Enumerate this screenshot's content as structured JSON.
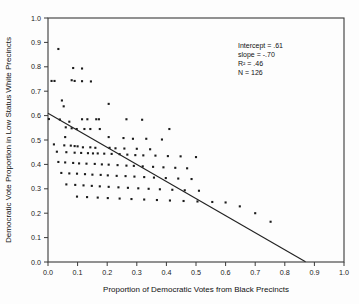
{
  "chart_data": {
    "type": "scatter",
    "title": "",
    "xlabel": "Proportion of Democratic Votes from Black Precincts",
    "ylabel": "Democratic Vote Proportion in Low Status White Precincts",
    "xlim": [
      0.0,
      1.0
    ],
    "ylim": [
      0.0,
      1.0
    ],
    "grid": false,
    "legend": null,
    "xticks": [
      "0.0",
      "0.1",
      "0.2",
      "0.3",
      "0.4",
      "0.5",
      "0.6",
      "0.7",
      "0.8",
      "0.9",
      "1.0"
    ],
    "yticks": [
      "0.0",
      "0.1",
      "0.2",
      "0.3",
      "0.4",
      "0.5",
      "0.6",
      "0.7",
      "0.8",
      "0.9",
      "1.0"
    ],
    "annotations": {
      "intercept_label": "Intercept = .61",
      "slope_label": "slope = -.70",
      "r2_label": "R² = .46",
      "n_label": "N = 126"
    },
    "regression": {
      "intercept": 0.61,
      "slope": -0.7,
      "r_squared": 0.46,
      "n": 126,
      "x_start": 0.0,
      "x_end": 0.87
    },
    "points": [
      [
        0.035,
        0.873
      ],
      [
        0.085,
        0.795
      ],
      [
        0.115,
        0.793
      ],
      [
        0.012,
        0.742
      ],
      [
        0.022,
        0.742
      ],
      [
        0.08,
        0.745
      ],
      [
        0.09,
        0.742
      ],
      [
        0.115,
        0.741
      ],
      [
        0.145,
        0.74
      ],
      [
        0.047,
        0.662
      ],
      [
        0.053,
        0.638
      ],
      [
        0.205,
        0.648
      ],
      [
        0.003,
        0.586
      ],
      [
        0.04,
        0.584
      ],
      [
        0.072,
        0.575
      ],
      [
        0.115,
        0.585
      ],
      [
        0.133,
        0.585
      ],
      [
        0.163,
        0.585
      ],
      [
        0.172,
        0.585
      ],
      [
        0.265,
        0.585
      ],
      [
        0.318,
        0.583
      ],
      [
        0.06,
        0.552
      ],
      [
        0.08,
        0.548
      ],
      [
        0.097,
        0.545
      ],
      [
        0.123,
        0.545
      ],
      [
        0.143,
        0.545
      ],
      [
        0.175,
        0.545
      ],
      [
        0.41,
        0.545
      ],
      [
        0.058,
        0.512
      ],
      [
        0.205,
        0.512
      ],
      [
        0.255,
        0.508
      ],
      [
        0.287,
        0.505
      ],
      [
        0.332,
        0.505
      ],
      [
        0.385,
        0.502
      ],
      [
        0.02,
        0.482
      ],
      [
        0.055,
        0.478
      ],
      [
        0.077,
        0.477
      ],
      [
        0.09,
        0.475
      ],
      [
        0.1,
        0.474
      ],
      [
        0.118,
        0.47
      ],
      [
        0.143,
        0.47
      ],
      [
        0.16,
        0.468
      ],
      [
        0.208,
        0.468
      ],
      [
        0.228,
        0.466
      ],
      [
        0.258,
        0.465
      ],
      [
        0.3,
        0.464
      ],
      [
        0.345,
        0.462
      ],
      [
        0.03,
        0.452
      ],
      [
        0.062,
        0.45
      ],
      [
        0.09,
        0.448
      ],
      [
        0.112,
        0.447
      ],
      [
        0.135,
        0.446
      ],
      [
        0.152,
        0.445
      ],
      [
        0.168,
        0.445
      ],
      [
        0.19,
        0.444
      ],
      [
        0.215,
        0.443
      ],
      [
        0.242,
        0.442
      ],
      [
        0.268,
        0.44
      ],
      [
        0.295,
        0.438
      ],
      [
        0.322,
        0.437
      ],
      [
        0.363,
        0.436
      ],
      [
        0.405,
        0.434
      ],
      [
        0.448,
        0.433
      ],
      [
        0.5,
        0.43
      ],
      [
        0.035,
        0.41
      ],
      [
        0.058,
        0.408
      ],
      [
        0.085,
        0.406
      ],
      [
        0.105,
        0.404
      ],
      [
        0.13,
        0.403
      ],
      [
        0.158,
        0.402
      ],
      [
        0.182,
        0.4
      ],
      [
        0.205,
        0.399
      ],
      [
        0.235,
        0.397
      ],
      [
        0.265,
        0.395
      ],
      [
        0.29,
        0.394
      ],
      [
        0.32,
        0.392
      ],
      [
        0.355,
        0.39
      ],
      [
        0.39,
        0.388
      ],
      [
        0.43,
        0.386
      ],
      [
        0.47,
        0.384
      ],
      [
        0.045,
        0.365
      ],
      [
        0.072,
        0.363
      ],
      [
        0.098,
        0.362
      ],
      [
        0.125,
        0.36
      ],
      [
        0.15,
        0.358
      ],
      [
        0.178,
        0.357
      ],
      [
        0.202,
        0.355
      ],
      [
        0.232,
        0.353
      ],
      [
        0.262,
        0.352
      ],
      [
        0.292,
        0.35
      ],
      [
        0.325,
        0.348
      ],
      [
        0.358,
        0.346
      ],
      [
        0.398,
        0.344
      ],
      [
        0.44,
        0.342
      ],
      [
        0.485,
        0.34
      ],
      [
        0.062,
        0.318
      ],
      [
        0.092,
        0.316
      ],
      [
        0.12,
        0.314
      ],
      [
        0.148,
        0.312
      ],
      [
        0.175,
        0.31
      ],
      [
        0.205,
        0.308
      ],
      [
        0.238,
        0.306
      ],
      [
        0.27,
        0.304
      ],
      [
        0.305,
        0.302
      ],
      [
        0.34,
        0.3
      ],
      [
        0.378,
        0.298
      ],
      [
        0.42,
        0.296
      ],
      [
        0.462,
        0.294
      ],
      [
        0.51,
        0.292
      ],
      [
        0.098,
        0.268
      ],
      [
        0.132,
        0.266
      ],
      [
        0.168,
        0.264
      ],
      [
        0.202,
        0.262
      ],
      [
        0.242,
        0.26
      ],
      [
        0.282,
        0.258
      ],
      [
        0.325,
        0.256
      ],
      [
        0.368,
        0.254
      ],
      [
        0.412,
        0.252
      ],
      [
        0.458,
        0.25
      ],
      [
        0.505,
        0.248
      ],
      [
        0.555,
        0.246
      ],
      [
        0.6,
        0.244
      ],
      [
        0.648,
        0.228
      ],
      [
        0.7,
        0.2
      ],
      [
        0.752,
        0.165
      ]
    ]
  },
  "figure": {
    "plot_left": 48,
    "plot_top": 18,
    "plot_right": 344,
    "plot_bottom": 262
  }
}
